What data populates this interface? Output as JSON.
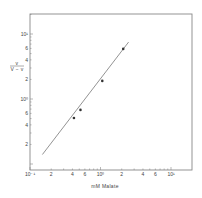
{
  "chart_data": {
    "type": "scatter",
    "title": "",
    "xlabel": "mM Malate",
    "ylabel": "v / (V − v)",
    "xscale": "log",
    "yscale": "log",
    "xlim": [
      0.1,
      16
    ],
    "ylim": [
      0.1,
      15
    ],
    "grid": false,
    "legend": null,
    "x_ticks": [
      {
        "value": 0.1,
        "label": "10⁻¹"
      },
      {
        "value": 0.2,
        "label": "2"
      },
      {
        "value": 0.4,
        "label": "4"
      },
      {
        "value": 0.6,
        "label": "6"
      },
      {
        "value": 1,
        "label": "10⁰"
      },
      {
        "value": 2,
        "label": "2"
      },
      {
        "value": 4,
        "label": "4"
      },
      {
        "value": 6,
        "label": "6"
      },
      {
        "value": 10,
        "label": "10¹"
      }
    ],
    "y_ticks": [
      {
        "value": 0.2,
        "label": "2"
      },
      {
        "value": 0.4,
        "label": "4"
      },
      {
        "value": 0.6,
        "label": "6"
      },
      {
        "value": 1,
        "label": "10⁰"
      },
      {
        "value": 2,
        "label": "2"
      },
      {
        "value": 4,
        "label": "4"
      },
      {
        "value": 6,
        "label": "6"
      },
      {
        "value": 10,
        "label": "10¹"
      }
    ],
    "series": [
      {
        "name": "data",
        "marker": "filled-circle",
        "points": [
          {
            "x": 0.42,
            "y": 0.51
          },
          {
            "x": 0.52,
            "y": 0.68
          },
          {
            "x": 1.06,
            "y": 1.9
          },
          {
            "x": 2.1,
            "y": 5.9
          }
        ]
      },
      {
        "name": "fit",
        "type": "line",
        "points": [
          {
            "x": 0.15,
            "y": 0.14
          },
          {
            "x": 2.5,
            "y": 7.5
          }
        ]
      }
    ]
  }
}
